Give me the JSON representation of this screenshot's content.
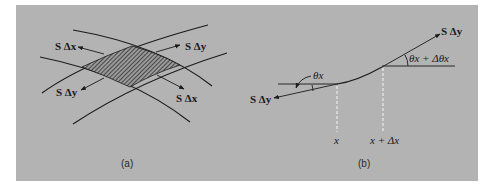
{
  "figure": {
    "background": "#b3b3b3",
    "line_color": "#1a1a1a",
    "panel_a": {
      "caption": "(a)",
      "labels": {
        "upper_left": "S Δx",
        "upper_right": "S Δy",
        "lower_left": "S Δy",
        "lower_right": "S Δx"
      },
      "hatched_region": "element"
    },
    "panel_b": {
      "caption": "(b)",
      "labels": {
        "upper_right_force": "S Δy",
        "lower_left_force": "S Δy",
        "angle_left": "θx",
        "angle_right": "θx + Δθx",
        "x_left": "x",
        "x_right": "x + Δx"
      }
    }
  }
}
